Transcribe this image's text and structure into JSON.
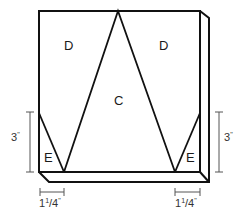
{
  "diagram": {
    "regions": [
      {
        "id": "D-left",
        "label": "D"
      },
      {
        "id": "D-right",
        "label": "D"
      },
      {
        "id": "C-center",
        "label": "C"
      },
      {
        "id": "E-left",
        "label": "E"
      },
      {
        "id": "E-right",
        "label": "E"
      }
    ],
    "dimensions": {
      "left_height": {
        "whole": "3",
        "mark": "\""
      },
      "right_height": {
        "whole": "3",
        "mark": "\""
      },
      "left_width": {
        "whole": "1",
        "num": "1",
        "slash": "/",
        "den": "4",
        "mark": "\""
      },
      "right_width": {
        "whole": "1",
        "num": "1",
        "slash": "/",
        "den": "4",
        "mark": "\""
      }
    },
    "colors": {
      "outline": "#111111",
      "dimension_line": "#555555",
      "background": "#ffffff"
    }
  }
}
